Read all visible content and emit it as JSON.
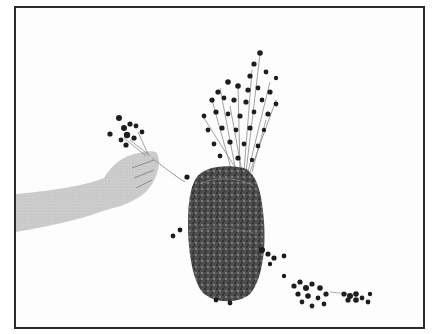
{
  "image": {
    "description": "Black-and-white photograph of a hand placing a small bunch of dried round-headed flowers into an oval moss-covered form; two small loose flower clusters lie on the table to the right.",
    "colors": {
      "background": "#fdfdfd",
      "frame": "#2a2a2a",
      "skin": "#c9c9c9",
      "moss_dark": "#3a3a3a",
      "moss_mid": "#6a6a6a",
      "flower_head": "#1e1e1e",
      "stem": "#8a8a8a"
    }
  }
}
